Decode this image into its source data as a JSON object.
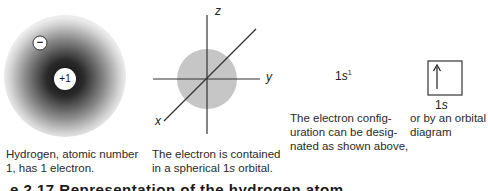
{
  "panel1": {
    "electron_label": "−",
    "nucleus_label": "+1",
    "caption_line1": "Hydrogen, atomic number",
    "caption_line2": "1, has 1 electron."
  },
  "panel2": {
    "axis_z": "z",
    "axis_y": "y",
    "axis_x": "x",
    "caption_line1": "The electron is contained",
    "caption_line2_pre": "in a spherical 1",
    "caption_line2_ital": "s",
    "caption_line2_post": " orbital."
  },
  "panel3": {
    "config_main": "1",
    "config_ital": "s",
    "config_sup": "1",
    "caption_line1": "The electron config-",
    "caption_line2": "uration can be desig-",
    "caption_line3": "nated as shown above,"
  },
  "panel4": {
    "arrow": "↑",
    "orbital_label_main": "1",
    "orbital_label_ital": "s",
    "caption_line1": "or by an orbital",
    "caption_line2": "diagram"
  },
  "figure_caption": "e 2.17   Representation of the hydrogen atom",
  "colors": {
    "sphere_core": "#111111",
    "sphere_edge": "#e6e6e6",
    "orbital_fill": "#c8c8c8",
    "axis_line": "#333333"
  }
}
